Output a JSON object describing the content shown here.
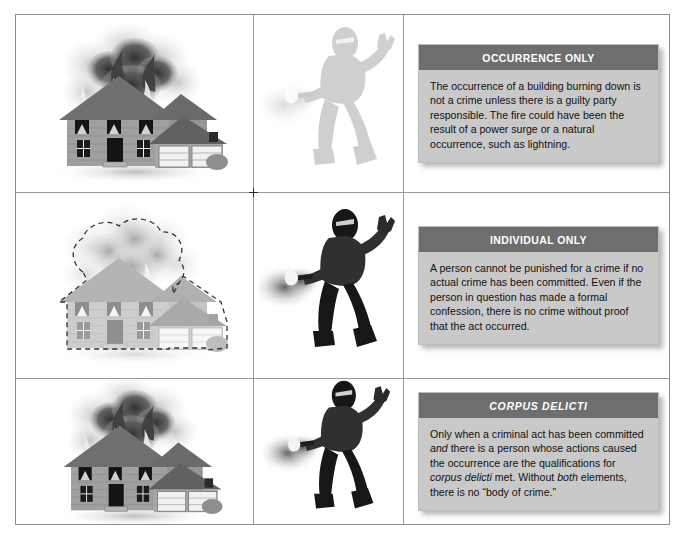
{
  "figure": {
    "columns": 3,
    "rows": 3,
    "column_roles": [
      "burning-house-illustration",
      "arsonist-illustration",
      "explanation-callout"
    ],
    "registration_mark": "crosshair"
  },
  "colors": {
    "callout_header_bg": "#6e6e6e",
    "callout_header_text": "#ffffff",
    "callout_body_bg": "#c9c9c9",
    "callout_body_text": "#111111",
    "frame_border": "#8d8d8d",
    "grid_line": "#9a9a9a",
    "house_siding": "#9d9d9d",
    "house_roof": "#6f6f6f",
    "smoke_dark": "#3a3a3a",
    "smoke_light": "#b9b9b9",
    "figure_dark": "#161616",
    "figure_ghost": "#9a9a9a"
  },
  "rows": [
    {
      "id": "occurrence-only",
      "house": {
        "state": "solid",
        "burning": true,
        "outline": "none",
        "alt": "Two-story house with attached garage fully engulfed, thick black smoke rising from three upper windows"
      },
      "person": {
        "state": "ghost",
        "alt": "Faded gray silhouette of a masked arsonist holding a lit torch"
      },
      "callout": {
        "title": "OCCURRENCE ONLY",
        "title_style": "upright",
        "body": "The occurrence of a building burning down is not a crime unless there is a guilty party responsible. The fire could have been the result of a power surge or a natural occurrence, such as lightning."
      }
    },
    {
      "id": "individual-only",
      "house": {
        "state": "ghost",
        "burning": true,
        "outline": "dashed",
        "alt": "Faded house outlined with a dashed line, indicating no actual fire occurred"
      },
      "person": {
        "state": "solid",
        "alt": "Masked arsonist in dark clothing holding a lit torch"
      },
      "callout": {
        "title": "INDIVIDUAL ONLY",
        "title_style": "upright",
        "body": "A person cannot be punished for a crime if no actual crime has been committed. Even if the person in question has made a formal confession, there is no crime without proof that the act occurred."
      }
    },
    {
      "id": "corpus-delicti",
      "house": {
        "state": "solid",
        "burning": true,
        "outline": "none",
        "alt": "Two-story house with attached garage fully engulfed, thick black smoke rising from three upper windows"
      },
      "person": {
        "state": "solid",
        "alt": "Masked arsonist in dark clothing holding a lit torch"
      },
      "callout": {
        "title": "CORPUS DELICTI",
        "title_style": "italic",
        "body_runs": [
          {
            "text": "Only when a criminal act has been committed ",
            "style": "normal"
          },
          {
            "text": "and",
            "style": "italic"
          },
          {
            "text": " there is a person whose actions caused the occurrence are the qualifications for ",
            "style": "normal"
          },
          {
            "text": "corpus delicti",
            "style": "italic"
          },
          {
            "text": " met. Without ",
            "style": "normal"
          },
          {
            "text": "both",
            "style": "italic"
          },
          {
            "text": " elements, there is no “body of crime.”",
            "style": "normal"
          }
        ]
      }
    }
  ]
}
